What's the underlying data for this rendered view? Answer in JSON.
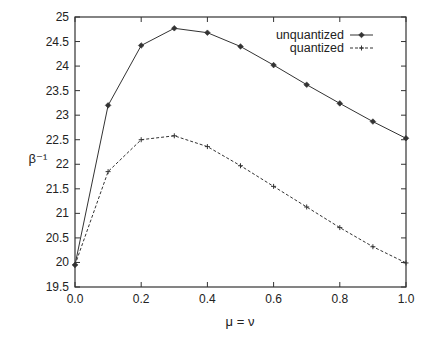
{
  "chart_data": {
    "type": "line",
    "title": "",
    "xlabel": "μ = ν",
    "ylabel": "β⁻¹",
    "xlim": [
      0.0,
      1.0
    ],
    "ylim": [
      19.5,
      25
    ],
    "grid": false,
    "legend_position": "upper right",
    "x_ticks": [
      "0.0",
      "0.2",
      "0.4",
      "0.6",
      "0.8",
      "1.0"
    ],
    "y_ticks": [
      "19.5",
      "20",
      "20.5",
      "21",
      "21.5",
      "22",
      "22.5",
      "23",
      "23.5",
      "24",
      "24.5",
      "25"
    ],
    "x": [
      0.0,
      0.1,
      0.2,
      0.3,
      0.4,
      0.5,
      0.6,
      0.7,
      0.8,
      0.9,
      1.0
    ],
    "series": [
      {
        "name": "unquantized",
        "style": "solid",
        "marker": "diamond",
        "values": [
          19.95,
          23.2,
          24.42,
          24.77,
          24.68,
          24.4,
          24.02,
          23.62,
          23.24,
          22.87,
          22.53
        ]
      },
      {
        "name": "quantized",
        "style": "dashed",
        "marker": "plus",
        "values": [
          19.95,
          21.85,
          22.5,
          22.58,
          22.36,
          21.97,
          21.55,
          21.13,
          20.71,
          20.32,
          19.99
        ]
      }
    ]
  },
  "colors": {
    "line": "#333333",
    "axis": "#333333",
    "background": "#ffffff"
  }
}
